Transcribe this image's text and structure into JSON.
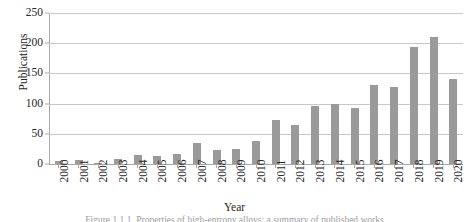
{
  "chart_data": {
    "type": "bar",
    "title": "",
    "xlabel": "Year",
    "ylabel": "Publications",
    "categories": [
      "2000",
      "2001",
      "2002",
      "2003",
      "2004",
      "2005",
      "2006",
      "2007",
      "2008",
      "2009",
      "2010",
      "2011",
      "2012",
      "2013",
      "2014",
      "2015",
      "2016",
      "2017",
      "2018",
      "2019",
      "2020"
    ],
    "values": [
      5,
      7,
      2,
      8,
      15,
      14,
      17,
      34,
      23,
      25,
      38,
      73,
      65,
      96,
      100,
      93,
      130,
      127,
      193,
      210,
      140
    ],
    "series": [
      {
        "name": "Publications",
        "values": [
          5,
          7,
          2,
          8,
          15,
          14,
          17,
          34,
          23,
          25,
          38,
          73,
          65,
          96,
          100,
          93,
          130,
          127,
          193,
          210,
          140
        ]
      }
    ],
    "ylim": [
      0,
      250
    ],
    "yticks": [
      0,
      50,
      100,
      150,
      200,
      250
    ],
    "ytick_labels": [
      "0",
      "50",
      "100",
      "150",
      "200",
      "250"
    ],
    "grid": true,
    "grid_axis": "y",
    "legend": false,
    "legend_position": "none",
    "bar_color": "#9a9a9a",
    "gridline_color": "#c8c8c8",
    "axis_color": "#a9a9a9"
  },
  "caption": {
    "text": "Figure 1.1.1. Properties of high-entropy alloys: a summary of published works"
  }
}
